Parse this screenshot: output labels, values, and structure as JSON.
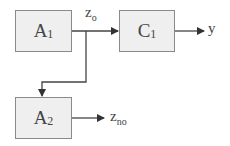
{
  "blocks": {
    "a1": {
      "main": "A",
      "sub": "1"
    },
    "c1": {
      "main": "C",
      "sub": "1"
    },
    "a2": {
      "main": "A",
      "sub": "2"
    }
  },
  "signals": {
    "zo": {
      "main": "z",
      "sub": "o"
    },
    "y": {
      "main": "y"
    },
    "zno": {
      "main": "z",
      "sub": "no"
    }
  }
}
